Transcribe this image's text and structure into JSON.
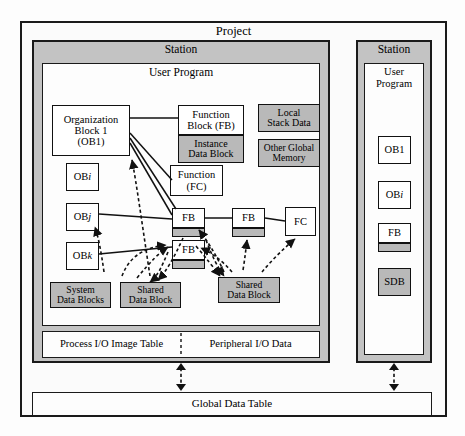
{
  "diagram": {
    "title": "Project",
    "type": "block-diagram"
  },
  "project": {
    "label": "Project"
  },
  "station_left": {
    "label": "Station",
    "user_program": {
      "label": "User Program"
    },
    "blocks": {
      "ob1": {
        "line1": "Organization",
        "line2": "Block 1",
        "line3": "(OB1)"
      },
      "obi": {
        "label": "OB",
        "sub": "i"
      },
      "obj": {
        "label": "OB",
        "sub": "j"
      },
      "obk": {
        "label": "OB",
        "sub": "k"
      },
      "function_block": {
        "line1": "Function",
        "line2": "Block (FB)"
      },
      "instance_data_block": {
        "line1": "Instance",
        "line2": "Data Block"
      },
      "function_fc": {
        "line1": "Function",
        "line2": "(FC)"
      },
      "local_stack_data": {
        "line1": "Local",
        "line2": "Stack Data"
      },
      "other_global_memory": {
        "line1": "Other Global",
        "line2": "Memory"
      },
      "fb_a": {
        "label": "FB"
      },
      "fb_b": {
        "label": "FB"
      },
      "fb_c": {
        "label": "FB"
      },
      "fc_right": {
        "label": "FC"
      },
      "system_data_blocks": {
        "line1": "System",
        "line2": "Data Blocks"
      },
      "shared_data_block_1": {
        "line1": "Shared",
        "line2": "Data Block"
      },
      "shared_data_block_2": {
        "line1": "Shared",
        "line2": "Data Block"
      }
    },
    "io_row": {
      "process_io": "Process I/O Image Table",
      "peripheral_io": "Peripheral I/O Data"
    }
  },
  "station_right": {
    "label": "Station",
    "user_program": {
      "line1": "User",
      "line2": "Program"
    },
    "blocks": {
      "ob1": {
        "label": "OB1"
      },
      "obi": {
        "label": "OB",
        "sub": "i"
      },
      "fb": {
        "label": "FB"
      },
      "sdb": {
        "label": "SDB"
      }
    }
  },
  "global_data_table": {
    "label": "Global Data Table"
  },
  "colors": {
    "gray_fill": "#b9b9b9",
    "station_fill": "#c3c3c3",
    "stroke": "#111111",
    "white_fill": "#ffffff"
  }
}
